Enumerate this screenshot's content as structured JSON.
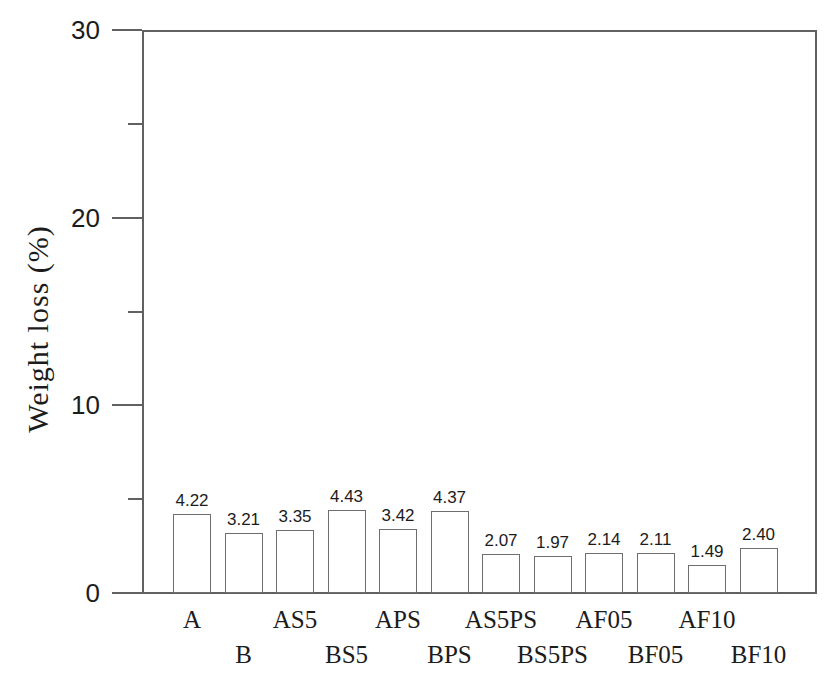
{
  "figure": {
    "background": "#ffffff",
    "axis_color": "#616161",
    "text_color": "#1c1c1c"
  },
  "chart_data": {
    "type": "bar",
    "title": "",
    "xlabel": "",
    "ylabel": "Weight loss (%)",
    "categories": [
      "A",
      "B",
      "AS5",
      "BS5",
      "APS",
      "BPS",
      "AS5PS",
      "BS5PS",
      "AF05",
      "BF05",
      "AF10",
      "BF10"
    ],
    "values": [
      4.22,
      3.21,
      3.35,
      4.43,
      3.42,
      4.37,
      2.07,
      1.97,
      2.14,
      2.11,
      1.49,
      2.4
    ],
    "value_labels": [
      "4.22",
      "3.21",
      "3.35",
      "4.43",
      "3.42",
      "4.37",
      "2.07",
      "1.97",
      "2.14",
      "2.11",
      "1.49",
      "2.40"
    ],
    "ylim": [
      0,
      30
    ],
    "yticks_major": [
      0,
      10,
      20,
      30
    ],
    "yticks_minor": [
      5,
      15,
      25
    ],
    "grid": false,
    "legend": null,
    "category_label_layout": "staggered-two-rows",
    "bar_fill": "#ffffff",
    "bar_outline": "#6e6e6e"
  }
}
